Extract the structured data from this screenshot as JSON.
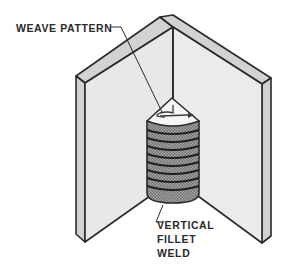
{
  "figure": {
    "labels": {
      "weave_pattern": "WEAVE PATTERN",
      "vertical_fillet_weld": [
        "VERTICAL",
        "FILLET",
        "WELD"
      ]
    },
    "colors": {
      "outline": "#2a2a2a",
      "panel_face": "#e6e6e6",
      "panel_edge": "#cfcfcf",
      "bead_fill": "#9a9a9a",
      "bead_highlight": "#c8c8c8",
      "cap_fill": "#f4f4f4",
      "background": "#ffffff"
    },
    "weld": {
      "bead_rings": 9
    }
  }
}
